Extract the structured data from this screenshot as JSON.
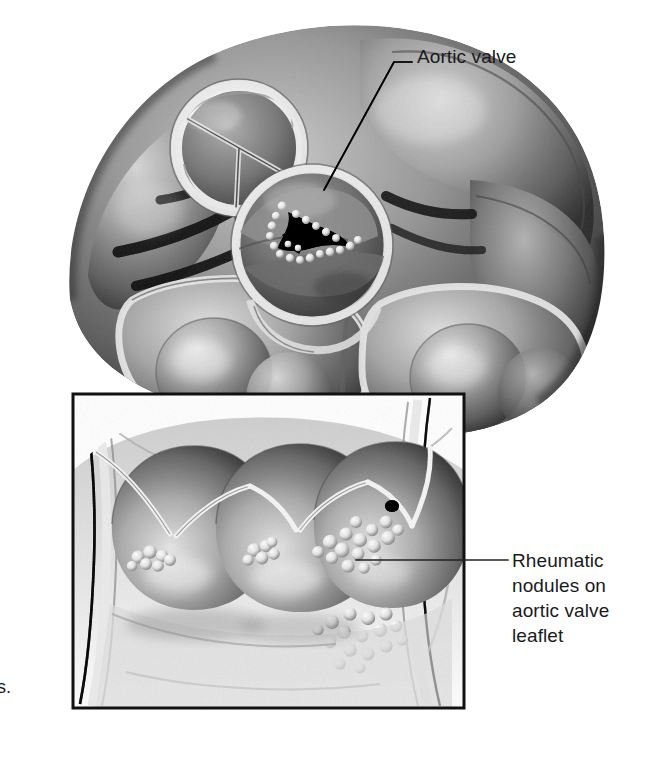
{
  "figure": {
    "kind": "medical-illustration",
    "rendering": "grayscale pen-and-ink / airbrush anatomical drawing",
    "background_color": "#ffffff",
    "ink_color": "#1a1a1a",
    "main_view": {
      "name": "superior view of heart base",
      "structures": [
        {
          "name": "pulmonary-valve",
          "note": "upper-left circular opening with three closed semilunar cusps"
        },
        {
          "name": "aortic-valve",
          "note": "center circular opening, stenotic slit-like orifice rimmed with pale nodules"
        },
        {
          "name": "ventricular-myocardium",
          "note": "large lobed muscular mass filling lower half"
        },
        {
          "name": "coronary-sulcus-vessels",
          "note": "dark branching grooves on left of heart base"
        }
      ]
    },
    "inset_view": {
      "name": "aortic valve leaflets, opened and laid flat",
      "border_color": "#111111",
      "border_width_px": 3,
      "structures": [
        {
          "name": "aortic-valve-leaflet-left",
          "nodule_cluster": "small"
        },
        {
          "name": "aortic-valve-leaflet-middle",
          "nodule_cluster": "small"
        },
        {
          "name": "aortic-valve-leaflet-right",
          "nodule_cluster": "large"
        },
        {
          "name": "coronary-ostium",
          "note": "small dark opening upper right of right leaflet"
        },
        {
          "name": "nodule-cluster-below-right-leaflet",
          "note": "verrucous vegetations along closure line"
        }
      ]
    }
  },
  "labels": [
    {
      "id": "aortic-valve",
      "text": "Aortic valve",
      "leader": "elbow leader line running left then diagonally down to the aortic valve orifice"
    },
    {
      "id": "rheumatic-nodules",
      "text": "Rheumatic\nnodules on\naortic valve\nleaflet",
      "leader": "horizontal leader line running left into the inset to the nodule cluster"
    }
  ],
  "caption_fragment": {
    "bullet": "•",
    "text": "s.",
    "note": "cropped caption text at left page margin"
  },
  "colors": {
    "background": "#ffffff",
    "ink": "#1a1a1a",
    "leader_line": "#222222",
    "inset_border": "#111111",
    "tissue_light": "#e8e8e8",
    "tissue_mid": "#b4b4b4",
    "tissue_dark": "#6a6a6a",
    "tissue_shadow": "#3a3a3a",
    "nodule_highlight": "#fdfdfd",
    "orifice_black": "#101010"
  }
}
